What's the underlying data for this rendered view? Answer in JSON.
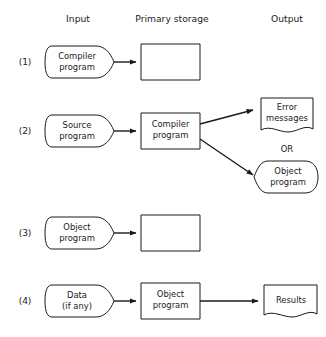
{
  "headers": {
    "input": "Input",
    "primary_storage": "Primary storage",
    "output": "Output"
  },
  "row_labels": {
    "r1": "(1)",
    "r2": "(2)",
    "r3": "(3)",
    "r4": "(4)"
  },
  "row1": {
    "input_line1": "Compiler",
    "input_line2": "program",
    "storage_text": ""
  },
  "row2": {
    "input_line1": "Source",
    "input_line2": "program",
    "storage_line1": "Compiler",
    "storage_line2": "program",
    "output_a_line1": "Error",
    "output_a_line2": "messages",
    "or_label": "OR",
    "output_b_line1": "Object",
    "output_b_line2": "program"
  },
  "row3": {
    "input_line1": "Object",
    "input_line2": "program",
    "storage_text": ""
  },
  "row4": {
    "input_line1": "Data",
    "input_line2": "(if any)",
    "storage_line1": "Object",
    "storage_line2": "program",
    "output_line1": "Results"
  },
  "colors": {
    "stroke": "#1a1a1a",
    "fill": "#ffffff",
    "background": "#ffffff"
  }
}
